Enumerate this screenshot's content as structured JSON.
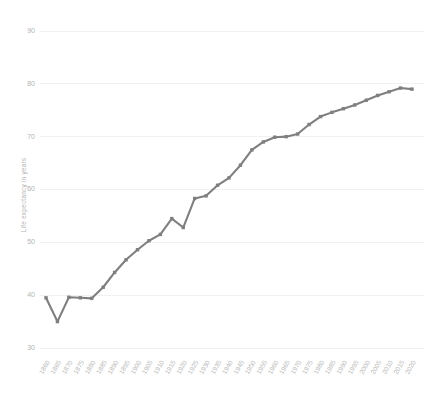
{
  "chart_data": {
    "type": "line",
    "title": "",
    "subtitle": "",
    "xlabel": "",
    "ylabel": "Life expectancy in years",
    "ylim": [
      28,
      93
    ],
    "xlim": [
      1858,
      2022
    ],
    "grid": true,
    "legend_position": "none",
    "series_color": "#7f7f7f",
    "yticks": [
      30,
      40,
      50,
      60,
      70,
      80,
      90
    ],
    "ytick_labels": [
      "30",
      "40",
      "50",
      "60",
      "70",
      "80",
      "90"
    ],
    "categories": [
      "1860",
      "1865",
      "1870",
      "1875",
      "1880",
      "1885",
      "1890",
      "1895",
      "1900",
      "1905",
      "1910",
      "1915",
      "1920",
      "1925",
      "1930",
      "1935",
      "1940",
      "1945",
      "1950",
      "1955",
      "1960",
      "1965",
      "1970",
      "1975",
      "1980",
      "1985",
      "1990",
      "1995",
      "2000",
      "2005",
      "2010",
      "2015",
      "2020"
    ],
    "x": [
      1860,
      1865,
      1870,
      1875,
      1880,
      1885,
      1890,
      1895,
      1900,
      1905,
      1910,
      1915,
      1920,
      1925,
      1930,
      1935,
      1940,
      1945,
      1950,
      1955,
      1960,
      1965,
      1970,
      1975,
      1980,
      1985,
      1990,
      1995,
      2000,
      2005,
      2010,
      2015,
      2020
    ],
    "values": [
      39.5,
      35.0,
      39.6,
      39.5,
      39.4,
      41.5,
      44.3,
      46.7,
      48.6,
      50.3,
      51.5,
      54.5,
      52.8,
      58.3,
      58.8,
      60.8,
      62.2,
      64.6,
      67.5,
      69.0,
      69.9,
      70.0,
      70.5,
      72.3,
      73.8,
      74.6,
      75.3,
      76.0,
      76.9,
      77.8,
      78.5,
      79.2,
      79.0
    ],
    "data_points": [
      {
        "year": "1860",
        "value": 39.5
      },
      {
        "year": "1865",
        "value": 35.0
      },
      {
        "year": "1870",
        "value": 39.6
      },
      {
        "year": "1875",
        "value": 39.5
      },
      {
        "year": "1880",
        "value": 39.4
      },
      {
        "year": "1885",
        "value": 41.5
      },
      {
        "year": "1890",
        "value": 44.3
      },
      {
        "year": "1895",
        "value": 46.7
      },
      {
        "year": "1900",
        "value": 48.6
      },
      {
        "year": "1905",
        "value": 50.3
      },
      {
        "year": "1910",
        "value": 51.5
      },
      {
        "year": "1915",
        "value": 54.5
      },
      {
        "year": "1920",
        "value": 52.8
      },
      {
        "year": "1925",
        "value": 58.3
      },
      {
        "year": "1930",
        "value": 58.8
      },
      {
        "year": "1935",
        "value": 60.8
      },
      {
        "year": "1940",
        "value": 62.2
      },
      {
        "year": "1945",
        "value": 64.6
      },
      {
        "year": "1950",
        "value": 67.5
      },
      {
        "year": "1955",
        "value": 69.0
      },
      {
        "year": "1960",
        "value": 69.9
      },
      {
        "year": "1965",
        "value": 70.0
      },
      {
        "year": "1970",
        "value": 70.5
      },
      {
        "year": "1975",
        "value": 72.3
      },
      {
        "year": "1980",
        "value": 73.8
      },
      {
        "year": "1985",
        "value": 74.6
      },
      {
        "year": "1990",
        "value": 75.3
      },
      {
        "year": "1995",
        "value": 76.0
      },
      {
        "year": "2000",
        "value": 76.9
      },
      {
        "year": "2005",
        "value": 77.8
      },
      {
        "year": "2010",
        "value": 78.5
      },
      {
        "year": "2015",
        "value": 79.2
      },
      {
        "year": "2020",
        "value": 79.0
      }
    ]
  }
}
